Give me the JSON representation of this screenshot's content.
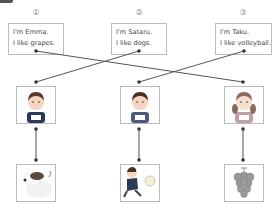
{
  "corner_tab": "exercise-marker",
  "items": [
    {
      "number": "①",
      "line1": "I'm Emma.",
      "line2": "I like grapes."
    },
    {
      "number": "②",
      "line1": "I'm Sataru.",
      "line2": "I like dogs."
    },
    {
      "number": "③",
      "line1": "I'm Taku.",
      "line2": "I like volleyball."
    }
  ],
  "people": [
    {
      "desc": "boy-with-bib",
      "bib": "ぽら"
    },
    {
      "desc": "boy-with-bib",
      "bib": "さく"
    },
    {
      "desc": "girl-with-pigtails",
      "bib": "えみ"
    }
  ],
  "things": [
    {
      "desc": "dog"
    },
    {
      "desc": "boy-playing-volleyball"
    },
    {
      "desc": "grapes"
    }
  ],
  "colors": {
    "line": "#555555",
    "border": "#bbbbbb",
    "text": "#444444"
  }
}
